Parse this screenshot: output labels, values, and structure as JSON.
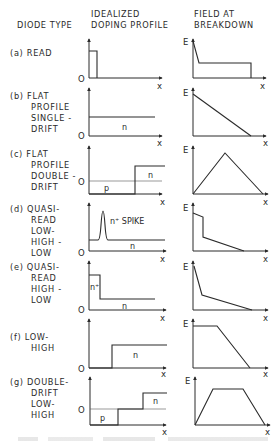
{
  "headers": {
    "diode_type": "DIODE TYPE",
    "doping_profile": [
      "IDEALIZED",
      "DOPING PROFILE"
    ],
    "field": [
      "FIELD AT",
      "BREAKDOWN"
    ]
  },
  "axis_labels": {
    "origin": "O",
    "x": "x",
    "e": "E"
  },
  "rows": [
    {
      "id": "a",
      "label": [
        "(a)  READ"
      ],
      "regions": []
    },
    {
      "id": "b",
      "label": [
        "(b)  FLAT",
        "PROFILE",
        "SINGLE -",
        "DRIFT"
      ],
      "regions": [
        "n"
      ]
    },
    {
      "id": "c",
      "label": [
        "(c)  FLAT",
        "PROFILE",
        "DOUBLE -",
        "DRIFT"
      ],
      "regions": [
        "p",
        "n"
      ]
    },
    {
      "id": "d",
      "label": [
        "(d)  QUASI-",
        "READ",
        "LOW-",
        "HIGH -",
        "LOW"
      ],
      "regions": [
        "n⁺ SPIKE",
        "n"
      ]
    },
    {
      "id": "e",
      "label": [
        "(e)  QUASI-",
        "READ",
        "HIGH -",
        "LOW"
      ],
      "regions": [
        "n⁺",
        "n"
      ]
    },
    {
      "id": "f",
      "label": [
        "(f)  LOW-",
        "HIGH"
      ],
      "regions": [
        "n"
      ]
    },
    {
      "id": "g",
      "label": [
        "(g)  DOUBLE-",
        "DRIFT",
        "LOW-",
        "HIGH"
      ],
      "regions": [
        "p",
        "n"
      ]
    }
  ]
}
